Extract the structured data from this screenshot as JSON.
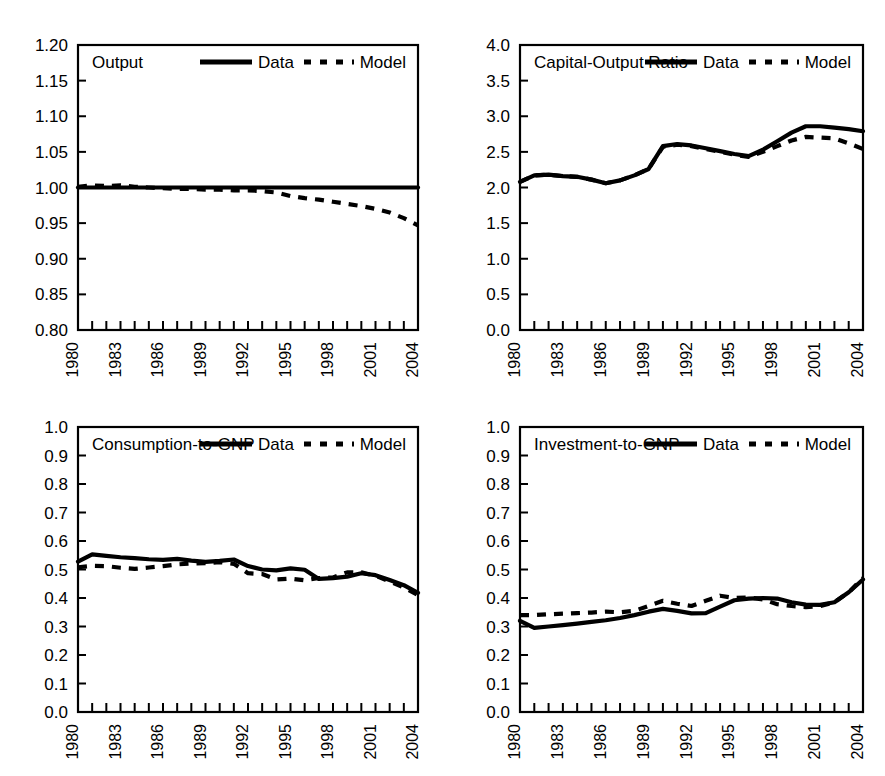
{
  "figure": {
    "width": 885,
    "height": 776,
    "background": "#ffffff",
    "ink_color": "#000000",
    "panel_count": 4,
    "legend_data_label": "Data",
    "legend_model_label": "Model"
  },
  "chart_data": [
    {
      "type": "line",
      "title": "Output",
      "panel_position": "top-left",
      "xlabel": "",
      "ylabel": "",
      "xlim": [
        1980,
        2004
      ],
      "ylim": [
        0.8,
        1.2
      ],
      "yticks": [
        "0.80",
        "0.85",
        "0.90",
        "0.95",
        "1.00",
        "1.05",
        "1.10",
        "1.15",
        "1.20"
      ],
      "ytick_values": [
        0.8,
        0.85,
        0.9,
        0.95,
        1.0,
        1.05,
        1.1,
        1.15,
        1.2
      ],
      "xticks": [
        "1980",
        "1983",
        "1986",
        "1989",
        "1992",
        "1995",
        "1998",
        "2001",
        "2004"
      ],
      "xtick_values": [
        1980,
        1983,
        1986,
        1989,
        1992,
        1995,
        1998,
        2001,
        2004
      ],
      "minor_xticks_every": 1,
      "grid": false,
      "legend_position": "top-right-inside",
      "x": [
        1980,
        1981,
        1982,
        1983,
        1984,
        1985,
        1986,
        1987,
        1988,
        1989,
        1990,
        1991,
        1992,
        1993,
        1994,
        1995,
        1996,
        1997,
        1998,
        1999,
        2000,
        2001,
        2002,
        2003,
        2004
      ],
      "series": [
        {
          "name": "Data",
          "style": "solid",
          "values": [
            1.0,
            1.0,
            1.0,
            1.0,
            1.0,
            1.0,
            1.0,
            1.0,
            1.0,
            1.0,
            1.0,
            1.0,
            1.0,
            1.0,
            1.0,
            1.0,
            1.0,
            1.0,
            1.0,
            1.0,
            1.0,
            1.0,
            1.0,
            1.0,
            1.0
          ]
        },
        {
          "name": "Model",
          "style": "dashed",
          "values": [
            1.001,
            1.003,
            1.002,
            1.003,
            1.001,
            1.0,
            0.999,
            0.998,
            0.998,
            0.997,
            0.997,
            0.996,
            0.996,
            0.995,
            0.993,
            0.988,
            0.985,
            0.983,
            0.98,
            0.977,
            0.974,
            0.97,
            0.965,
            0.957,
            0.947
          ]
        }
      ]
    },
    {
      "type": "line",
      "title": "Capital-Output Ratio",
      "panel_position": "top-right",
      "xlabel": "",
      "ylabel": "",
      "xlim": [
        1980,
        2004
      ],
      "ylim": [
        0.0,
        4.0
      ],
      "yticks": [
        "0.0",
        "0.5",
        "1.0",
        "1.5",
        "2.0",
        "2.5",
        "3.0",
        "3.5",
        "4.0"
      ],
      "ytick_values": [
        0.0,
        0.5,
        1.0,
        1.5,
        2.0,
        2.5,
        3.0,
        3.5,
        4.0
      ],
      "xticks": [
        "1980",
        "1983",
        "1986",
        "1989",
        "1992",
        "1995",
        "1998",
        "2001",
        "2004"
      ],
      "xtick_values": [
        1980,
        1983,
        1986,
        1989,
        1992,
        1995,
        1998,
        2001,
        2004
      ],
      "minor_xticks_every": 1,
      "grid": false,
      "legend_position": "top-right-inside",
      "x": [
        1980,
        1981,
        1982,
        1983,
        1984,
        1985,
        1986,
        1987,
        1988,
        1989,
        1990,
        1991,
        1992,
        1993,
        1994,
        1995,
        1996,
        1997,
        1998,
        1999,
        2000,
        2001,
        2002,
        2003,
        2004
      ],
      "series": [
        {
          "name": "Data",
          "style": "solid",
          "values": [
            2.08,
            2.17,
            2.18,
            2.16,
            2.15,
            2.11,
            2.06,
            2.1,
            2.17,
            2.26,
            2.58,
            2.61,
            2.59,
            2.55,
            2.51,
            2.47,
            2.44,
            2.53,
            2.65,
            2.77,
            2.86,
            2.86,
            2.84,
            2.82,
            2.79
          ]
        },
        {
          "name": "Model",
          "style": "dashed",
          "values": [
            2.08,
            2.17,
            2.18,
            2.16,
            2.15,
            2.11,
            2.06,
            2.1,
            2.17,
            2.26,
            2.57,
            2.6,
            2.58,
            2.54,
            2.5,
            2.46,
            2.43,
            2.5,
            2.58,
            2.66,
            2.71,
            2.7,
            2.69,
            2.62,
            2.54
          ]
        }
      ]
    },
    {
      "type": "line",
      "title": "Consumption-to-GNP",
      "panel_position": "bottom-left",
      "xlabel": "",
      "ylabel": "",
      "xlim": [
        1980,
        2004
      ],
      "ylim": [
        0.0,
        1.0
      ],
      "yticks": [
        "0.0",
        "0.1",
        "0.2",
        "0.3",
        "0.4",
        "0.5",
        "0.6",
        "0.7",
        "0.8",
        "0.9",
        "1.0"
      ],
      "ytick_values": [
        0.0,
        0.1,
        0.2,
        0.3,
        0.4,
        0.5,
        0.6,
        0.7,
        0.8,
        0.9,
        1.0
      ],
      "xticks": [
        "1980",
        "1983",
        "1986",
        "1989",
        "1992",
        "1995",
        "1998",
        "2001",
        "2004"
      ],
      "xtick_values": [
        1980,
        1983,
        1986,
        1989,
        1992,
        1995,
        1998,
        2001,
        2004
      ],
      "minor_xticks_every": 1,
      "grid": false,
      "legend_position": "top-right-inside",
      "x": [
        1980,
        1981,
        1982,
        1983,
        1984,
        1985,
        1986,
        1987,
        1988,
        1989,
        1990,
        1991,
        1992,
        1993,
        1994,
        1995,
        1996,
        1997,
        1998,
        1999,
        2000,
        2001,
        2002,
        2003,
        2004
      ],
      "series": [
        {
          "name": "Data",
          "style": "solid",
          "values": [
            0.528,
            0.553,
            0.548,
            0.543,
            0.54,
            0.536,
            0.534,
            0.537,
            0.531,
            0.527,
            0.53,
            0.535,
            0.512,
            0.5,
            0.497,
            0.504,
            0.499,
            0.467,
            0.47,
            0.475,
            0.472,
            0.469,
            0.478,
            0.487,
            0.487
          ]
        },
        {
          "name": "Model",
          "style": "dashed",
          "values": [
            0.508,
            0.513,
            0.512,
            0.506,
            0.502,
            0.507,
            0.512,
            0.518,
            0.521,
            0.522,
            0.526,
            0.52,
            0.487,
            0.484,
            0.465,
            0.468,
            0.462,
            0.47,
            0.472,
            0.49,
            0.495,
            0.498,
            0.49,
            0.48,
            0.47
          ]
        }
      ],
      "series_tail_note": "both series converge and decline to about 0.41 at 2004",
      "data_tail": [
        0.487,
        0.48,
        0.463,
        0.445,
        0.418
      ],
      "model_tail": [
        0.49,
        0.478,
        0.458,
        0.437,
        0.41
      ]
    },
    {
      "type": "line",
      "title": "Investment-to-GNP",
      "panel_position": "bottom-right",
      "xlabel": "",
      "ylabel": "",
      "xlim": [
        1980,
        2004
      ],
      "ylim": [
        0.0,
        1.0
      ],
      "yticks": [
        "0.0",
        "0.1",
        "0.2",
        "0.3",
        "0.4",
        "0.5",
        "0.6",
        "0.7",
        "0.8",
        "0.9",
        "1.0"
      ],
      "ytick_values": [
        0.0,
        0.1,
        0.2,
        0.3,
        0.4,
        0.5,
        0.6,
        0.7,
        0.8,
        0.9,
        1.0
      ],
      "xticks": [
        "1980",
        "1983",
        "1986",
        "1989",
        "1992",
        "1995",
        "1998",
        "2001",
        "2004"
      ],
      "xtick_values": [
        1980,
        1983,
        1986,
        1989,
        1992,
        1995,
        1998,
        2001,
        2004
      ],
      "minor_xticks_every": 1,
      "grid": false,
      "legend_position": "top-right-inside",
      "x": [
        1980,
        1981,
        1982,
        1983,
        1984,
        1985,
        1986,
        1987,
        1988,
        1989,
        1990,
        1991,
        1992,
        1993,
        1994,
        1995,
        1996,
        1997,
        1998,
        1999,
        2000,
        2001,
        2002,
        2003,
        2004
      ],
      "series": [
        {
          "name": "Data",
          "style": "solid",
          "values": [
            0.32,
            0.295,
            0.3,
            0.305,
            0.31,
            0.316,
            0.322,
            0.33,
            0.34,
            0.352,
            0.362,
            0.355,
            0.346,
            0.347,
            0.37,
            0.392,
            0.398,
            0.4,
            0.398,
            0.385,
            0.377,
            0.376,
            0.385,
            0.42,
            0.465
          ]
        },
        {
          "name": "Model",
          "style": "dashed",
          "values": [
            0.34,
            0.34,
            0.343,
            0.345,
            0.347,
            0.349,
            0.352,
            0.35,
            0.355,
            0.372,
            0.39,
            0.38,
            0.372,
            0.39,
            0.408,
            0.4,
            0.402,
            0.395,
            0.378,
            0.372,
            0.368,
            0.372,
            0.385,
            0.42,
            0.47
          ]
        }
      ]
    }
  ]
}
